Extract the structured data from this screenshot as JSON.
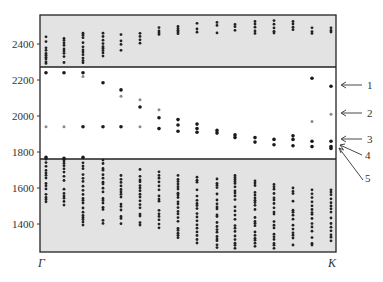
{
  "chart_data": {
    "type": "scatter",
    "title": "",
    "xlabel": "",
    "ylabel": "",
    "x_tick_labels": [
      "Γ",
      "K"
    ],
    "y_ticks": [
      1400,
      1600,
      1800,
      2000,
      2200,
      2400
    ],
    "ylim": [
      1244,
      2561
    ],
    "grid": false,
    "legend": null,
    "shaded_bands": [
      {
        "from": 2272,
        "to": 2561,
        "color": "#e4e4e4"
      },
      {
        "from": 1244,
        "to": 1761,
        "color": "#e4e4e4"
      }
    ],
    "annotations": [
      {
        "label": "1",
        "target_value": 2165
      },
      {
        "label": "2",
        "target_value": 2010
      },
      {
        "label": "3",
        "target_value": 1860
      },
      {
        "label": "4",
        "target_value": 1830
      },
      {
        "label": "5",
        "target_value": 1820
      }
    ],
    "columns": 16,
    "gap_modes": [
      {
        "col": 0,
        "dark": [
          2240,
          1770
        ],
        "light": [
          1940
        ]
      },
      {
        "col": 1,
        "dark": [
          2240,
          1765
        ],
        "light": [
          1940
        ]
      },
      {
        "col": 2,
        "dark": [
          2240,
          1770
        ],
        "light": [
          2220
        ]
      },
      {
        "col": 2,
        "dark": [
          1940
        ],
        "light": []
      },
      {
        "col": 3,
        "dark": [
          2185,
          1940
        ],
        "light": []
      },
      {
        "col": 4,
        "dark": [
          2145,
          1940
        ],
        "light": [
          2110
        ]
      },
      {
        "col": 5,
        "dark": [
          2050
        ],
        "light": [
          2090,
          1940
        ]
      },
      {
        "col": 6,
        "dark": [
          1990,
          1930
        ],
        "light": [
          2035
        ]
      },
      {
        "col": 7,
        "dark": [
          1980,
          1950,
          1915
        ],
        "light": []
      },
      {
        "col": 8,
        "dark": [
          1955,
          1930,
          1910
        ],
        "light": []
      },
      {
        "col": 9,
        "dark": [
          1920,
          1905
        ],
        "light": []
      },
      {
        "col": 10,
        "dark": [
          1895,
          1880
        ],
        "light": []
      },
      {
        "col": 11,
        "dark": [
          1880,
          1855
        ],
        "light": []
      },
      {
        "col": 12,
        "dark": [
          1870,
          1840
        ],
        "light": []
      },
      {
        "col": 13,
        "dark": [
          1890,
          1870,
          1835
        ],
        "light": []
      },
      {
        "col": 14,
        "dark": [
          2210,
          1860,
          1830
        ],
        "light": [
          1970
        ]
      },
      {
        "col": 15,
        "dark": [
          2165,
          1860,
          1830,
          1820
        ],
        "light": [
          2010
        ]
      }
    ],
    "upper_band_columns": [
      {
        "col": 0,
        "range": [
          2290,
          2440
        ]
      },
      {
        "col": 1,
        "range": [
          2290,
          2445
        ]
      },
      {
        "col": 2,
        "range": [
          2290,
          2460
        ]
      },
      {
        "col": 3,
        "range": [
          2330,
          2460
        ]
      },
      {
        "col": 4,
        "range": [
          2360,
          2465
        ]
      },
      {
        "col": 5,
        "range": [
          2400,
          2470
        ]
      },
      {
        "col": 6,
        "range": [
          2440,
          2500
        ]
      },
      {
        "col": 7,
        "range": [
          2450,
          2510
        ]
      },
      {
        "col": 8,
        "range": [
          2450,
          2515
        ]
      },
      {
        "col": 9,
        "range": [
          2450,
          2520
        ]
      },
      {
        "col": 10,
        "range": [
          2450,
          2525
        ]
      },
      {
        "col": 11,
        "range": [
          2450,
          2525
        ]
      },
      {
        "col": 12,
        "range": [
          2450,
          2530
        ]
      },
      {
        "col": 13,
        "range": [
          2450,
          2525
        ]
      },
      {
        "col": 14,
        "range": [
          2450,
          2490
        ]
      },
      {
        "col": 15,
        "range": [
          2450,
          2490
        ]
      }
    ],
    "lower_band_columns": [
      {
        "col": 0,
        "range": [
          1500,
          1760
        ]
      },
      {
        "col": 1,
        "range": [
          1490,
          1760
        ]
      },
      {
        "col": 2,
        "range": [
          1390,
          1760
        ]
      },
      {
        "col": 3,
        "range": [
          1400,
          1755
        ]
      },
      {
        "col": 4,
        "range": [
          1400,
          1740
        ]
      },
      {
        "col": 5,
        "range": [
          1390,
          1720
        ]
      },
      {
        "col": 6,
        "range": [
          1360,
          1690
        ]
      },
      {
        "col": 7,
        "range": [
          1310,
          1670
        ]
      },
      {
        "col": 8,
        "range": [
          1280,
          1660
        ]
      },
      {
        "col": 9,
        "range": [
          1260,
          1650
        ]
      },
      {
        "col": 10,
        "range": [
          1260,
          1670
        ]
      },
      {
        "col": 11,
        "range": [
          1260,
          1640
        ]
      },
      {
        "col": 12,
        "range": [
          1260,
          1620
        ]
      },
      {
        "col": 13,
        "range": [
          1280,
          1600
        ]
      },
      {
        "col": 14,
        "range": [
          1280,
          1590
        ]
      },
      {
        "col": 15,
        "range": [
          1280,
          1590
        ]
      }
    ]
  },
  "labels": {
    "gamma": "Γ",
    "k": "K",
    "y2400": "2400",
    "y2200": "2200",
    "y2000": "2000",
    "y1800": "1800",
    "y1600": "1600",
    "y1400": "1400",
    "a1": "1",
    "a2": "2",
    "a3": "3",
    "a4": "4",
    "a5": "5"
  }
}
